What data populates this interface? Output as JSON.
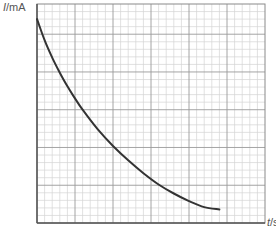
{
  "chart_data": {
    "type": "line",
    "title": "",
    "xlabel": "t/s",
    "ylabel": "I/mA",
    "x_var": "t",
    "x_unit": "s",
    "y_var": "I",
    "y_unit": "mA",
    "grid": true,
    "grid_minor_cells_x": 30,
    "grid_minor_cells_y": 29,
    "grid_major_every": 5,
    "tick_labels": [],
    "note": "No numeric tick labels shown; values below are in grid-cell units from origin (bottom-left).",
    "series": [
      {
        "name": "I vs t (decay curve)",
        "x": [
          0,
          1,
          2,
          3,
          4,
          5,
          6,
          8,
          10,
          12,
          14,
          16,
          18,
          20,
          22,
          24
        ],
        "y": [
          27,
          24.2,
          21.9,
          19.9,
          18.1,
          16.5,
          15.0,
          12.4,
          10.2,
          8.3,
          6.6,
          5.1,
          3.9,
          2.9,
          2.1,
          1.8
        ]
      }
    ],
    "colors": {
      "curve": "#333333",
      "grid_minor": "#d4d4d4",
      "grid_major": "#9a9a9a",
      "axis": "#555555"
    }
  },
  "labels": {
    "y_axis_var": "I",
    "y_axis_unit": "/mA",
    "x_axis_var": "t",
    "x_axis_unit": "/s"
  }
}
